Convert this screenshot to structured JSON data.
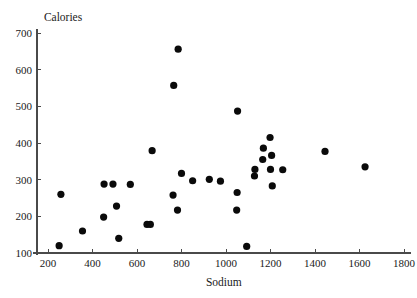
{
  "chart_data": {
    "type": "scatter",
    "title": "",
    "xlabel": "Sodium",
    "ylabel": "Calories",
    "xlim": [
      150,
      1830
    ],
    "ylim": [
      85,
      710
    ],
    "xticks": [
      200,
      400,
      600,
      800,
      1000,
      1200,
      1400,
      1600,
      1800
    ],
    "xticklabels": [
      "200",
      "400",
      "600",
      "800",
      "1000",
      "1200",
      "1400",
      "1600",
      "1800"
    ],
    "yticks": [
      100,
      200,
      300,
      400,
      500,
      600,
      700
    ],
    "yticklabels": [
      "100",
      "200",
      "300",
      "400",
      "500",
      "600",
      "700"
    ],
    "grid": false,
    "legend": false,
    "marker": "filled-circle",
    "marker_color": "#0a0a0a",
    "marker_size_px": 4,
    "points": [
      {
        "x": 250,
        "y": 120
      },
      {
        "x": 258,
        "y": 260
      },
      {
        "x": 355,
        "y": 160
      },
      {
        "x": 450,
        "y": 198
      },
      {
        "x": 452,
        "y": 288
      },
      {
        "x": 492,
        "y": 288
      },
      {
        "x": 508,
        "y": 228
      },
      {
        "x": 518,
        "y": 140
      },
      {
        "x": 570,
        "y": 287
      },
      {
        "x": 645,
        "y": 178
      },
      {
        "x": 660,
        "y": 178
      },
      {
        "x": 668,
        "y": 379
      },
      {
        "x": 762,
        "y": 258
      },
      {
        "x": 765,
        "y": 557
      },
      {
        "x": 782,
        "y": 217
      },
      {
        "x": 785,
        "y": 656
      },
      {
        "x": 800,
        "y": 317
      },
      {
        "x": 850,
        "y": 297
      },
      {
        "x": 925,
        "y": 301
      },
      {
        "x": 975,
        "y": 296
      },
      {
        "x": 1048,
        "y": 217
      },
      {
        "x": 1050,
        "y": 265
      },
      {
        "x": 1052,
        "y": 487
      },
      {
        "x": 1093,
        "y": 118
      },
      {
        "x": 1128,
        "y": 310
      },
      {
        "x": 1130,
        "y": 328
      },
      {
        "x": 1165,
        "y": 355
      },
      {
        "x": 1168,
        "y": 386
      },
      {
        "x": 1198,
        "y": 415
      },
      {
        "x": 1200,
        "y": 328
      },
      {
        "x": 1205,
        "y": 366
      },
      {
        "x": 1208,
        "y": 283
      },
      {
        "x": 1255,
        "y": 327
      },
      {
        "x": 1445,
        "y": 377
      },
      {
        "x": 1625,
        "y": 335
      }
    ]
  },
  "axes": {
    "y_label_text": "Calories",
    "x_label_text": "Sodium"
  }
}
